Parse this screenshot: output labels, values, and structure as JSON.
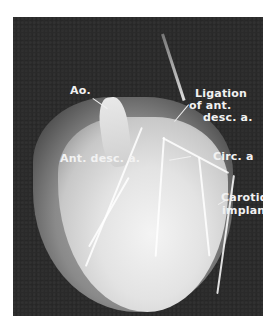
{
  "figure": {
    "labels": {
      "aorta": "Ao.",
      "ligation_line1": "Ligation",
      "ligation_line2": "of ant.",
      "ligation_line3": "desc. a.",
      "ant_desc": "Ant. desc. a.",
      "circ": "Circ. a",
      "carotid_line1": "Carotid",
      "carotid_line2": "implant"
    }
  }
}
